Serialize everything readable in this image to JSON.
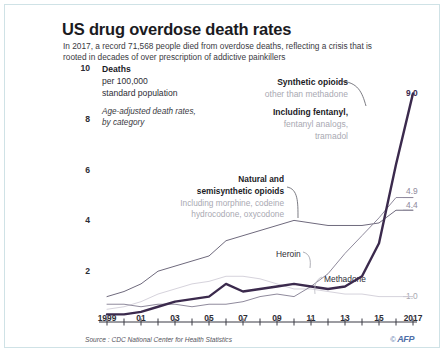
{
  "header": {
    "title": "US drug overdose death rates",
    "subtitle": "In 2017, a record 71,568 people died from overdose deaths, reflecting a crisis that is rooted in decades of over prescription of addictive painkillers"
  },
  "legend_block": {
    "line1": "Deaths",
    "line2": "per 100,000",
    "line3": "standard population",
    "line4": "Age-adjusted death rates,",
    "line5": "by category"
  },
  "annotations": {
    "synthetic": {
      "l1": "Synthetic opioids",
      "l2": "other than methadone",
      "l3": "Including fentanyl,",
      "l4": "fentanyl analogs,",
      "l5": "tramadol"
    },
    "natural": {
      "l1": "Natural and",
      "l2": "semisynthetic opioids",
      "l3": "Including morphine, codeine",
      "l4": "hydrocodone, oxycodone"
    },
    "heroin_label": "Heroin",
    "methadone_label": "Methadone"
  },
  "end_values": {
    "synthetic": "9.0",
    "heroin": "4.9",
    "natural": "4.4",
    "methadone": "1.0"
  },
  "footer": {
    "source": "Source : CDC National Center for Health Statistics",
    "copyright": "©",
    "agency": "AFP"
  },
  "colors": {
    "synthetic": "#3b2a4d",
    "heroin": "#8f8a9c",
    "natural": "#6f6a7d",
    "methadone": "#d6d3dc",
    "frame": "#cfe2e6",
    "axis": "#3b3b44",
    "grey_text": "#a9a9b2"
  },
  "chart_data": {
    "type": "line",
    "title": "US drug overdose death rates",
    "xlabel": "",
    "ylabel": "Deaths per 100,000 standard population",
    "ylim": [
      0,
      10
    ],
    "xlim": [
      1999,
      2017
    ],
    "grid": false,
    "legend_position": "inline-annotations",
    "y_ticks": [
      "10",
      "8",
      "6",
      "4",
      "2"
    ],
    "y_tick_values": [
      10,
      8,
      6,
      4,
      2
    ],
    "x_ticks": [
      "1999",
      "01",
      "03",
      "05",
      "07",
      "09",
      "11",
      "13",
      "15",
      "2017"
    ],
    "x_tick_values": [
      1999,
      2001,
      2003,
      2005,
      2007,
      2009,
      2011,
      2013,
      2015,
      2017
    ],
    "x": [
      1999,
      2000,
      2001,
      2002,
      2003,
      2004,
      2005,
      2006,
      2007,
      2008,
      2009,
      2010,
      2011,
      2012,
      2013,
      2014,
      2015,
      2016,
      2017
    ],
    "series": [
      {
        "name": "Synthetic opioids other than methadone",
        "color": "#3b2a4d",
        "end_label": "9.0",
        "values": [
          0.3,
          0.3,
          0.4,
          0.6,
          0.8,
          0.9,
          1.0,
          1.5,
          1.2,
          1.3,
          1.4,
          1.5,
          1.4,
          1.3,
          1.4,
          1.8,
          3.1,
          6.2,
          9.0
        ]
      },
      {
        "name": "Heroin",
        "color": "#8f8a9c",
        "end_label": "4.9",
        "values": [
          0.7,
          0.7,
          0.6,
          0.7,
          0.7,
          0.6,
          0.7,
          0.7,
          0.8,
          1.0,
          1.1,
          1.0,
          1.4,
          1.9,
          2.7,
          3.4,
          4.1,
          4.9,
          4.9
        ]
      },
      {
        "name": "Natural and semisynthetic opioids",
        "color": "#6f6a7d",
        "end_label": "4.4",
        "values": [
          1.0,
          1.2,
          1.5,
          2.0,
          2.2,
          2.4,
          2.6,
          3.2,
          3.4,
          3.6,
          3.8,
          4.0,
          3.9,
          3.8,
          3.8,
          3.8,
          3.9,
          4.4,
          4.4
        ]
      },
      {
        "name": "Methadone",
        "color": "#d6d3dc",
        "end_label": "1.0",
        "values": [
          0.5,
          0.6,
          0.8,
          1.1,
          1.3,
          1.5,
          1.6,
          1.8,
          1.8,
          1.7,
          1.5,
          1.3,
          1.3,
          1.2,
          1.1,
          1.1,
          1.0,
          1.0,
          1.0
        ]
      }
    ],
    "annotations": [
      {
        "text": "Synthetic opioids other than methadone. Including fentanyl, fentanyl analogs, tramadol",
        "target": "Synthetic opioids other than methadone"
      },
      {
        "text": "Natural and semisynthetic opioids. Including morphine, codeine hydrocodone, oxycodone",
        "target": "Natural and semisynthetic opioids"
      },
      {
        "text": "Heroin",
        "target": "Heroin"
      },
      {
        "text": "Methadone",
        "target": "Methadone"
      }
    ],
    "source": "Source : CDC National Center for Health Statistics"
  }
}
